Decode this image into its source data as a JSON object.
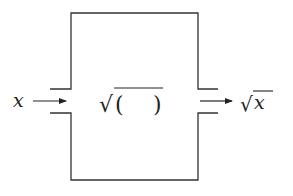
{
  "diagram": {
    "type": "function-machine",
    "input_label": "x",
    "function_label": {
      "radical": "√",
      "open_paren": "(",
      "close_paren": ")"
    },
    "output_label": {
      "radical": "√",
      "variable": "x"
    },
    "colors": {
      "stroke": "#333333",
      "text": "#222222",
      "background": "#ffffff"
    }
  }
}
